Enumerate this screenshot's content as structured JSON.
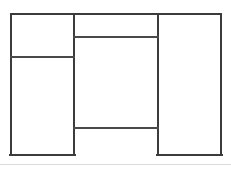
{
  "canvas": {
    "width": 231,
    "height": 170,
    "background": "#ffffff",
    "title": "Wireframe Layout Diagram"
  },
  "style": {
    "outer_stroke_color": "#3c3c3c",
    "inner_stroke_color": "#4a4a4a",
    "outer_stroke_width": 2.2,
    "inner_stroke_width": 1.8,
    "footer_rule_color": "#d8dade",
    "footer_rule_width": 1
  },
  "frame": {
    "label": "outer-frame",
    "x1": 11,
    "y1": 14,
    "x2": 221,
    "y2": 155,
    "width": 210,
    "height": 141,
    "bottom_edge_segments": [
      {
        "x1": 11,
        "x2": 74
      },
      {
        "x1": 158,
        "x2": 221
      }
    ]
  },
  "dividers": {
    "vertical": [
      {
        "name": "left-middle-divider",
        "x": 74,
        "y1": 14,
        "y2": 155
      },
      {
        "name": "middle-right-divider",
        "x": 158,
        "y1": 14,
        "y2": 155
      }
    ],
    "horizontal": [
      {
        "name": "left-column-divider",
        "y": 57,
        "x1": 11,
        "x2": 74
      },
      {
        "name": "middle-top-divider",
        "y": 37,
        "x1": 74,
        "x2": 158
      },
      {
        "name": "middle-bottom-divider",
        "y": 128,
        "x1": 74,
        "x2": 158
      }
    ]
  },
  "regions": [
    {
      "name": "left-top-panel",
      "x": 11,
      "y": 14,
      "width": 63,
      "height": 43,
      "label": ""
    },
    {
      "name": "left-bottom-panel",
      "x": 11,
      "y": 57,
      "width": 63,
      "height": 98,
      "label": ""
    },
    {
      "name": "middle-top-strip",
      "x": 74,
      "y": 14,
      "width": 84,
      "height": 23,
      "label": ""
    },
    {
      "name": "middle-main-panel",
      "x": 74,
      "y": 37,
      "width": 84,
      "height": 91,
      "label": ""
    },
    {
      "name": "middle-bottom-open-area",
      "x": 74,
      "y": 128,
      "width": 84,
      "height": 27,
      "label": ""
    },
    {
      "name": "right-full-height-panel",
      "x": 158,
      "y": 14,
      "width": 63,
      "height": 141,
      "label": ""
    }
  ],
  "footer": {
    "name": "footer-rule",
    "y": 164,
    "x1": 0,
    "x2": 231,
    "label": ""
  }
}
